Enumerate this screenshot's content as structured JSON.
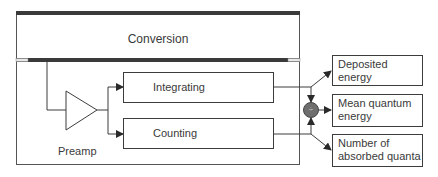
{
  "diagram": {
    "conversion": {
      "label": "Conversion"
    },
    "preamp": {
      "label": "Preamp"
    },
    "integrating": {
      "label": "Integrating"
    },
    "counting": {
      "label": "Counting"
    },
    "divider": {
      "symbol": "÷"
    },
    "outputs": [
      {
        "line1": "Deposited",
        "line2": "energy"
      },
      {
        "line1": "Mean quantum",
        "line2": "energy"
      },
      {
        "line1": "Number of",
        "line2": "absorbed quanta"
      }
    ],
    "colors": {
      "line": "#3c3c3c",
      "bar": "#3a3a3a",
      "node_fill": "#6e6e6e",
      "text": "#3a3a3a"
    }
  }
}
